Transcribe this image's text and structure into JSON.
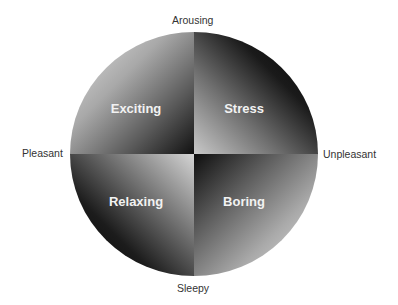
{
  "axes": {
    "top": "Arousing",
    "bottom": "Sleepy",
    "left": "Pleasant",
    "right": "Unpleasant"
  },
  "quadrants": [
    {
      "position": "top-left",
      "label": "Exciting"
    },
    {
      "position": "top-right",
      "label": "Stress"
    },
    {
      "position": "bottom-left",
      "label": "Relaxing"
    },
    {
      "position": "bottom-right",
      "label": "Boring"
    }
  ]
}
